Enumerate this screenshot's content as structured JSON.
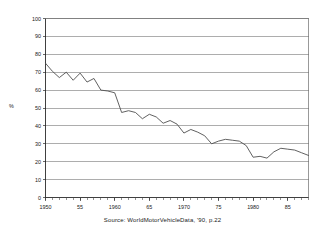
{
  "chart_data": {
    "type": "line",
    "title": "",
    "xlabel": "",
    "ylabel": "%",
    "ylim": [
      0,
      100
    ],
    "xlim": [
      1950,
      1988
    ],
    "ytick_values": [
      0,
      10,
      20,
      30,
      40,
      50,
      60,
      70,
      80,
      90,
      100
    ],
    "ytick_labels": [
      "0",
      "10",
      "20",
      "30",
      "40",
      "50",
      "60",
      "70",
      "80",
      "90",
      "100"
    ],
    "xtick_values": [
      1950,
      1955,
      1960,
      1965,
      1970,
      1975,
      1980,
      1985
    ],
    "xtick_labels": [
      "1950",
      "55",
      "1960",
      "65",
      "1970",
      "75",
      "1980",
      "85"
    ],
    "grid": true,
    "legend": false,
    "minor_xticks": "annual",
    "source": "Source: WorldMotorVehicleData, '90, p.22",
    "x": [
      1950,
      1951,
      1952,
      1953,
      1954,
      1955,
      1956,
      1957,
      1958,
      1959,
      1960,
      1961,
      1962,
      1963,
      1964,
      1965,
      1966,
      1967,
      1968,
      1969,
      1970,
      1971,
      1972,
      1973,
      1974,
      1975,
      1976,
      1977,
      1978,
      1979,
      1980,
      1981,
      1982,
      1983,
      1984,
      1985,
      1986,
      1987,
      1988
    ],
    "values": [
      75.0,
      70.5,
      67.0,
      70.0,
      65.5,
      69.5,
      64.5,
      66.5,
      60.0,
      59.5,
      58.5,
      47.5,
      48.5,
      47.5,
      44.0,
      46.5,
      45.0,
      41.5,
      43.0,
      41.0,
      36.0,
      38.0,
      36.5,
      34.5,
      30.0,
      31.5,
      32.5,
      32.0,
      31.5,
      29.0,
      22.5,
      23.0,
      22.0,
      25.5,
      27.5,
      27.0,
      26.5,
      25.0,
      23.5
    ],
    "series_name": "US share of world motor vehicle production"
  },
  "axis": {
    "y_title": "%"
  }
}
